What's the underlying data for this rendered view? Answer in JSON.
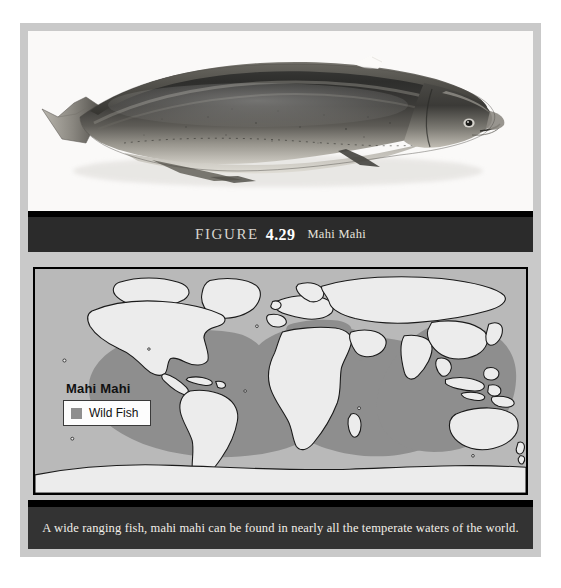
{
  "figure": {
    "label": "FIGURE",
    "number": "4.29",
    "subject": "Mahi Mahi",
    "photo_alt": "mahi-mahi-specimen-photo"
  },
  "map": {
    "title": "Mahi Mahi",
    "legend": {
      "swatch_label": "Wild Fish",
      "swatch_color": "#8e8e8e"
    },
    "colors": {
      "ocean": "#b9b9b9",
      "land": "#ececec",
      "distribution": "#8e8e8e",
      "outline": "#111111",
      "border": "#000000"
    },
    "regions_shaded": [
      "Tropical and temperate Atlantic Ocean",
      "Mediterranean Sea",
      "Indian Ocean",
      "Tropical and temperate Pacific Ocean"
    ]
  },
  "caption": {
    "text": "A wide ranging fish, mahi mahi can be found in nearly all the temperate waters of the world."
  },
  "page": {
    "frame_color": "#c9c9c9",
    "bar_color": "#2b2b2b",
    "caption_bar_color": "#333333",
    "background": "#ffffff"
  }
}
